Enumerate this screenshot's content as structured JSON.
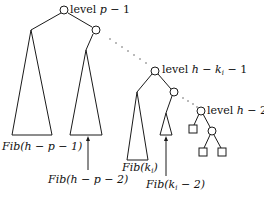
{
  "diagram": {
    "type": "fibonacci-tree-recursion",
    "colors": {
      "stroke": "#1a1a1a",
      "background": "#ffffff",
      "text": "#111111"
    },
    "levels": [
      {
        "id": "level-p-1",
        "prefix": "level ",
        "var": "p",
        "suffix": " − 1"
      },
      {
        "id": "level-h-ki-1",
        "prefix": "level ",
        "var": "h − k",
        "sub": "i",
        "suffix": " − 1"
      },
      {
        "id": "level-h-2",
        "prefix": "level ",
        "var": "h",
        "suffix": " − 2"
      }
    ],
    "subtree_labels": [
      {
        "id": "fib-h-p-1",
        "fn": "Fib",
        "arg": "(h − p − 1)"
      },
      {
        "id": "fib-h-p-2",
        "fn": "Fib",
        "arg": "(h − p − 2)"
      },
      {
        "id": "fib-ki",
        "fn": "Fib",
        "arg_pre": "(k",
        "sub": "i",
        "arg_post": ")"
      },
      {
        "id": "fib-ki-2",
        "fn": "Fib",
        "arg_pre": "(k",
        "sub": "i",
        "arg_post": " − 2)"
      }
    ]
  }
}
